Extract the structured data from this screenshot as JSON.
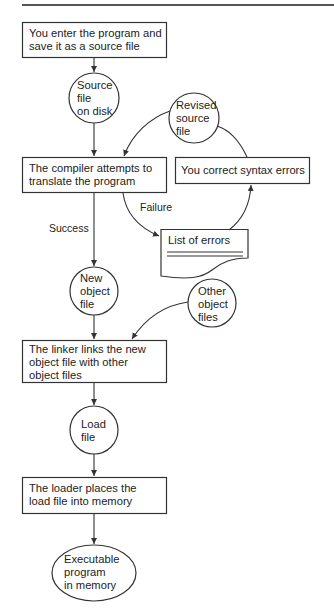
{
  "diagram": {
    "title": "",
    "boxes": {
      "enter": "You enter the program and\nsave it as a source file",
      "compiler": "The compiler attempts to\ntranslate the program",
      "correct": "You correct syntax errors",
      "linker": "The linker links the new\nobject file with other\nobject files",
      "loader": "The loader places the\nload file into memory"
    },
    "circles": {
      "source": "Source\nfile\non disk",
      "revised": "Revised\nsource\nfile",
      "new_object": "New\nobject\nfile",
      "other_object": "Other\nobject\nfiles",
      "load": "Load\nfile",
      "executable": "Executable\nprogram\nin memory"
    },
    "document": {
      "errors": "List of errors"
    },
    "edge_labels": {
      "success": "Success",
      "failure": "Failure"
    },
    "colors": {
      "stroke": "#333333",
      "text": "#222222",
      "background": "#ffffff"
    }
  }
}
